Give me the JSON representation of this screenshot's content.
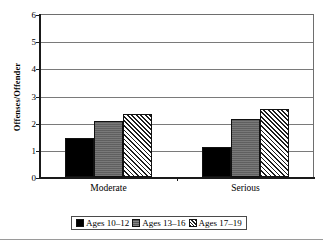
{
  "chart_data": {
    "type": "bar",
    "title": "",
    "xlabel": "",
    "ylabel": "Offenses/Offender",
    "categories": [
      "Moderate",
      "Serious"
    ],
    "series": [
      {
        "name": "Ages 10–12",
        "values": [
          1.45,
          1.1
        ],
        "fill": "solid-black",
        "color": "#000000"
      },
      {
        "name": "Ages 13–16",
        "values": [
          2.08,
          2.15
        ],
        "fill": "solid-gray",
        "color": "#6a6a6a"
      },
      {
        "name": "Ages 17–19",
        "values": [
          2.32,
          2.5
        ],
        "fill": "diagonal-hatch",
        "color": "#1d1d1d"
      }
    ],
    "ylim": [
      0,
      6
    ],
    "yticks": [
      0,
      1,
      2,
      3,
      4,
      5,
      6
    ],
    "ytick_labels": [
      "0",
      "1",
      "2",
      "3",
      "4",
      "5",
      "6"
    ],
    "grid": true,
    "legend_position": "bottom"
  },
  "legend": {
    "items": [
      {
        "label": "Ages 10–12"
      },
      {
        "label": "Ages 13–16"
      },
      {
        "label": "Ages 17–19"
      }
    ]
  }
}
